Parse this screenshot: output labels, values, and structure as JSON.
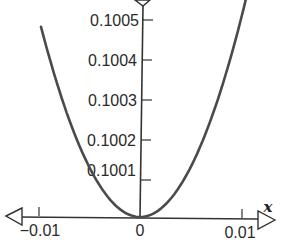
{
  "chart_data": {
    "type": "line",
    "title": "",
    "xlabel": "x",
    "ylabel": "y",
    "function": "y = 0.1 + 5x^2",
    "x_ticks": [
      -0.01,
      0,
      0.01
    ],
    "x_tick_labels": [
      "−0.01",
      "0",
      "0.01"
    ],
    "y_ticks": [
      0.1001,
      0.1002,
      0.1003,
      0.1004,
      0.1005
    ],
    "y_tick_labels": [
      "0.1001",
      "0.1002",
      "0.1003",
      "0.1004",
      "0.1005"
    ],
    "xlim": [
      -0.0135,
      0.0135
    ],
    "ylim": [
      0.1,
      0.10055
    ],
    "grid": false,
    "legend": null,
    "series": [
      {
        "name": "parabola",
        "x": [
          -0.0098,
          -0.0075,
          -0.005,
          -0.0025,
          0,
          0.0025,
          0.005,
          0.0075,
          0.0105
        ],
        "y": [
          0.10048,
          0.10028,
          0.100125,
          0.100031,
          0.1,
          0.100031,
          0.100125,
          0.10028,
          0.10055
        ]
      }
    ],
    "colors": {
      "curve": "#4a4a4a",
      "axes": "#333333"
    }
  }
}
